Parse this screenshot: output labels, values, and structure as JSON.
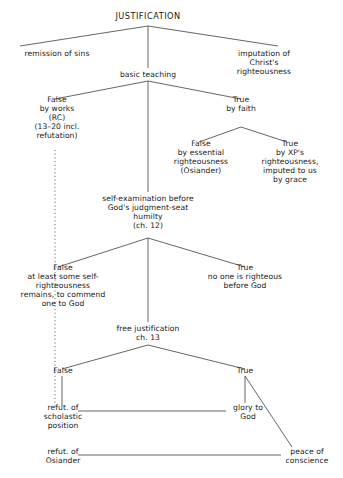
{
  "diagram": {
    "title": "JUSTIFICATION",
    "type": "tree-outline",
    "nodes": [
      {
        "id": "justification",
        "label": "JUSTIFICATION",
        "x": 148,
        "y": 12,
        "role": "root"
      },
      {
        "id": "remission",
        "label": "remission of sins",
        "x": 57,
        "y": 50,
        "role": "branch-leaf"
      },
      {
        "id": "imputation",
        "label": "imputation of\nChrist's righteousness",
        "x": 264,
        "y": 50,
        "role": "branch-leaf"
      },
      {
        "id": "basic-teaching",
        "label": "basic teaching",
        "x": 148,
        "y": 71,
        "role": "node"
      },
      {
        "id": "false-by-works",
        "label": "False\nby works\n(RC)\n(13–20 incl.\nrefutation)",
        "x": 57,
        "y": 96,
        "role": "node"
      },
      {
        "id": "true-by-faith",
        "label": "True\nby faith",
        "x": 241,
        "y": 96,
        "role": "node"
      },
      {
        "id": "false-essential",
        "label": "False\nby essential\nrighteousness\n(Osiander)",
        "x": 201,
        "y": 140,
        "role": "node"
      },
      {
        "id": "true-xp",
        "label": "True\nby XP's\nrighteousness,\nimputed to us\nby grace",
        "x": 290,
        "y": 140,
        "role": "node"
      },
      {
        "id": "self-examination",
        "label": "self-examination before\nGod's judgment-seat\nhumilty\n(ch. 12)",
        "x": 148,
        "y": 195,
        "role": "node"
      },
      {
        "id": "false-self-righteous",
        "label": "False\nat least some self-\nrighteousness\nremains, to commend\none to God",
        "x": 63,
        "y": 264,
        "role": "node"
      },
      {
        "id": "true-none-righteous",
        "label": "True\nno one is righteous\nbefore God",
        "x": 245,
        "y": 264,
        "role": "node"
      },
      {
        "id": "free-justification",
        "label": "free justification\nch. 13",
        "x": 148,
        "y": 325,
        "role": "node"
      },
      {
        "id": "false-ch13",
        "label": "False",
        "x": 63,
        "y": 367,
        "role": "node"
      },
      {
        "id": "true-ch13",
        "label": "True",
        "x": 245,
        "y": 367,
        "role": "node"
      },
      {
        "id": "refut-scholastic",
        "label": "refut. of\nscholastic\nposition",
        "x": 63,
        "y": 404,
        "role": "node"
      },
      {
        "id": "glory-to-god",
        "label": "glory to\nGod",
        "x": 248,
        "y": 404,
        "role": "node"
      },
      {
        "id": "refut-osiander",
        "label": "refut. of\nOsiander",
        "x": 63,
        "y": 448,
        "role": "node"
      },
      {
        "id": "peace-of-conscience",
        "label": "peace of\nconscience",
        "x": 307,
        "y": 448,
        "role": "node"
      }
    ],
    "edges": [
      {
        "id": "e-just-remission",
        "from": "justification",
        "to": "remission",
        "style": "solid",
        "shape": "diagonal"
      },
      {
        "id": "e-just-imputation",
        "from": "justification",
        "to": "imputation",
        "style": "solid",
        "shape": "diagonal"
      },
      {
        "id": "e-just-basic",
        "from": "justification",
        "to": "basic-teaching",
        "style": "solid",
        "shape": "vertical"
      },
      {
        "id": "e-basic-false",
        "from": "basic-teaching",
        "to": "false-by-works",
        "style": "solid",
        "shape": "diagonal"
      },
      {
        "id": "e-basic-true",
        "from": "basic-teaching",
        "to": "true-by-faith",
        "style": "solid",
        "shape": "diagonal"
      },
      {
        "id": "e-basic-self",
        "from": "basic-teaching",
        "to": "self-examination",
        "style": "solid",
        "shape": "vertical"
      },
      {
        "id": "e-faith-false",
        "from": "true-by-faith",
        "to": "false-essential",
        "style": "solid",
        "shape": "diagonal"
      },
      {
        "id": "e-faith-true",
        "from": "true-by-faith",
        "to": "true-xp",
        "style": "solid",
        "shape": "diagonal"
      },
      {
        "id": "e-self-false",
        "from": "self-examination",
        "to": "false-self-righteous",
        "style": "solid",
        "shape": "diagonal"
      },
      {
        "id": "e-self-true",
        "from": "self-examination",
        "to": "true-none-righteous",
        "style": "solid",
        "shape": "diagonal"
      },
      {
        "id": "e-self-free",
        "from": "self-examination",
        "to": "free-justification",
        "style": "solid",
        "shape": "vertical"
      },
      {
        "id": "e-free-false",
        "from": "free-justification",
        "to": "false-ch13",
        "style": "solid",
        "shape": "diagonal"
      },
      {
        "id": "e-free-true",
        "from": "free-justification",
        "to": "true-ch13",
        "style": "solid",
        "shape": "diagonal"
      },
      {
        "id": "e-rc-dotted",
        "from": "false-by-works",
        "to": "refut-scholastic",
        "style": "dotted",
        "shape": "vertical"
      },
      {
        "id": "e-false13-refut",
        "from": "false-ch13",
        "to": "refut-scholastic",
        "style": "solid",
        "shape": "vertical"
      },
      {
        "id": "e-true13-glory",
        "from": "true-ch13",
        "to": "glory-to-god",
        "style": "solid",
        "shape": "vertical"
      },
      {
        "id": "e-true13-peace",
        "from": "true-ch13",
        "to": "peace-of-conscience",
        "style": "solid",
        "shape": "diagonal"
      },
      {
        "id": "e-scholastic-glory",
        "from": "refut-scholastic",
        "to": "glory-to-god",
        "style": "solid",
        "shape": "horizontal"
      },
      {
        "id": "e-osiander-peace",
        "from": "refut-osiander",
        "to": "peace-of-conscience",
        "style": "solid",
        "shape": "horizontal"
      }
    ],
    "style": {
      "line_color": "#4a4a4a",
      "text_color": "#1a1a1a",
      "background": "#ffffff"
    }
  }
}
